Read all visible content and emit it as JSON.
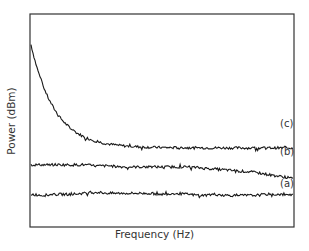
{
  "chart_data": {
    "type": "line",
    "title": "",
    "xlabel": "Frequency (Hz)",
    "ylabel": "Power (dBm)",
    "grid": false,
    "legend_position": "inline-right",
    "x_ticks": [],
    "y_ticks": [],
    "x": [
      0,
      0.05,
      0.1,
      0.15,
      0.2,
      0.25,
      0.3,
      0.35,
      0.4,
      0.45,
      0.5,
      0.55,
      0.6,
      0.65,
      0.7,
      0.75,
      0.8,
      0.85,
      0.9,
      0.95,
      1.0
    ],
    "series": [
      {
        "name": "(c)",
        "label": "(c)",
        "values": [
          0.86,
          0.62,
          0.48,
          0.42,
          0.39,
          0.38,
          0.375,
          0.37,
          0.37,
          0.37,
          0.37,
          0.37,
          0.365,
          0.375,
          0.37,
          0.37,
          0.365,
          0.36,
          0.36,
          0.365,
          0.36
        ]
      },
      {
        "name": "(b)",
        "label": "(b)",
        "values": [
          0.29,
          0.29,
          0.29,
          0.29,
          0.29,
          0.285,
          0.285,
          0.28,
          0.28,
          0.28,
          0.28,
          0.28,
          0.28,
          0.275,
          0.27,
          0.265,
          0.26,
          0.255,
          0.245,
          0.235,
          0.225
        ]
      },
      {
        "name": "(a)",
        "label": "(a)",
        "values": [
          0.15,
          0.145,
          0.15,
          0.15,
          0.155,
          0.16,
          0.155,
          0.155,
          0.155,
          0.155,
          0.15,
          0.155,
          0.15,
          0.145,
          0.15,
          0.145,
          0.145,
          0.145,
          0.15,
          0.15,
          0.145
        ]
      }
    ],
    "ylim": [
      0,
      1
    ],
    "xlim": [
      0,
      1
    ]
  },
  "labels": {
    "xlabel": "Frequency (Hz)",
    "ylabel": "Power (dBm)",
    "c": "(c)",
    "b": "(b)",
    "a": "(a)"
  },
  "colors": {
    "line": "#1a1a1a",
    "axis": "#333333",
    "background": "#ffffff"
  }
}
